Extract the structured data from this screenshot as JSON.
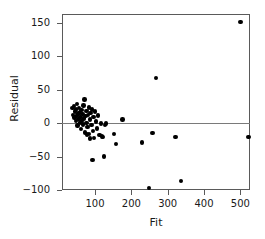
{
  "chart_data": {
    "type": "scatter",
    "title": "",
    "xlabel": "Fit",
    "ylabel": "Residual",
    "xlim": [
      0,
      540
    ],
    "ylim": [
      -115,
      165
    ],
    "xticks": [
      100,
      200,
      300,
      400,
      500
    ],
    "xtick_labels": [
      "100",
      "200",
      "300",
      "400",
      "500"
    ],
    "yticks": [
      -100,
      -50,
      0,
      50,
      100,
      150
    ],
    "ytick_labels": [
      "−100",
      "−50",
      "0",
      "50",
      "100",
      "150"
    ],
    "grid": false,
    "legend": null,
    "reference_line": {
      "orientation": "horizontal",
      "y": 0,
      "color": "#7a7a7a"
    },
    "marker": {
      "shape": "circle",
      "color": "#000000",
      "size": 4.4
    },
    "points": [
      {
        "x": 38,
        "y": 22
      },
      {
        "x": 40,
        "y": 12
      },
      {
        "x": 42,
        "y": 25
      },
      {
        "x": 44,
        "y": 8
      },
      {
        "x": 45,
        "y": 17
      },
      {
        "x": 47,
        "y": 3
      },
      {
        "x": 48,
        "y": 20
      },
      {
        "x": 50,
        "y": 11
      },
      {
        "x": 51,
        "y": 28
      },
      {
        "x": 52,
        "y": -4
      },
      {
        "x": 54,
        "y": 14
      },
      {
        "x": 55,
        "y": 6
      },
      {
        "x": 56,
        "y": 22
      },
      {
        "x": 58,
        "y": 1
      },
      {
        "x": 59,
        "y": 16
      },
      {
        "x": 60,
        "y": 9
      },
      {
        "x": 61,
        "y": -9
      },
      {
        "x": 63,
        "y": 19
      },
      {
        "x": 64,
        "y": 4
      },
      {
        "x": 66,
        "y": 13
      },
      {
        "x": 67,
        "y": -2
      },
      {
        "x": 68,
        "y": 26
      },
      {
        "x": 70,
        "y": 7
      },
      {
        "x": 71,
        "y": 35
      },
      {
        "x": 73,
        "y": -14
      },
      {
        "x": 74,
        "y": 10
      },
      {
        "x": 76,
        "y": 0
      },
      {
        "x": 77,
        "y": 18
      },
      {
        "x": 79,
        "y": -6
      },
      {
        "x": 81,
        "y": 12
      },
      {
        "x": 83,
        "y": 23
      },
      {
        "x": 84,
        "y": -16
      },
      {
        "x": 86,
        "y": 5
      },
      {
        "x": 88,
        "y": 15
      },
      {
        "x": 90,
        "y": -3
      },
      {
        "x": 92,
        "y": 20
      },
      {
        "x": 94,
        "y": -12
      },
      {
        "x": 96,
        "y": 9
      },
      {
        "x": 98,
        "y": -22
      },
      {
        "x": 100,
        "y": 17
      },
      {
        "x": 103,
        "y": 2
      },
      {
        "x": 106,
        "y": -8
      },
      {
        "x": 109,
        "y": 11
      },
      {
        "x": 112,
        "y": -18
      },
      {
        "x": 116,
        "y": -1
      },
      {
        "x": 78,
        "y": -17
      },
      {
        "x": 86,
        "y": -23
      },
      {
        "x": 93,
        "y": -55
      },
      {
        "x": 119,
        "y": -20
      },
      {
        "x": 122,
        "y": -21
      },
      {
        "x": 124,
        "y": -50
      },
      {
        "x": 128,
        "y": -3
      },
      {
        "x": 131,
        "y": -1
      },
      {
        "x": 152,
        "y": -16
      },
      {
        "x": 158,
        "y": -31
      },
      {
        "x": 176,
        "y": 5
      },
      {
        "x": 230,
        "y": -29
      },
      {
        "x": 248,
        "y": -97
      },
      {
        "x": 258,
        "y": -15
      },
      {
        "x": 268,
        "y": 67
      },
      {
        "x": 322,
        "y": -21
      },
      {
        "x": 336,
        "y": -87
      },
      {
        "x": 500,
        "y": 151
      },
      {
        "x": 522,
        "y": -21
      }
    ]
  }
}
